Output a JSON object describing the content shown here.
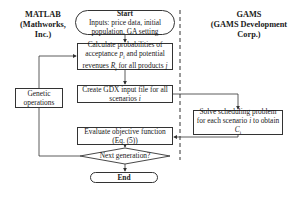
{
  "lanes": {
    "left": {
      "title_line1": "MATLAB",
      "title_line2": "(Mathworks,",
      "title_line3": "Inc.)"
    },
    "right": {
      "title_line1": "GAMS",
      "title_line2": "(GAMS Development",
      "title_line3": "Corp.)"
    }
  },
  "nodes": {
    "start": {
      "title": "Start",
      "line1": "Inputs: price data, initial",
      "line2": "population, GA setting"
    },
    "calc": {
      "line1": "Calculate probabilities of",
      "line2_prefix": "acceptance ",
      "line2_var": "p",
      "line2_sub": "j",
      "line2_suffix": " and potential",
      "line3_prefix": "revenues ",
      "line3_var": "R",
      "line3_sub": "j",
      "line3_suffix": " for all products ",
      "line3_var2": "j"
    },
    "gdx": {
      "line1": "Create GDX input file for all",
      "line2_prefix": "scenarios ",
      "line2_var": "i"
    },
    "genetic": {
      "line1": "Genetic",
      "line2": "operations"
    },
    "solve": {
      "line1": "Solve scheduling problem",
      "line2_prefix": "for each scenario ",
      "line2_var": "i",
      "line2_suffix": " to obtain",
      "line3_var": "C",
      "line3_sub": "i"
    },
    "evaluate": {
      "line1": "Evaluate objective function",
      "line2": "(Eq. (5))"
    },
    "decision": {
      "label": "Next generation?"
    },
    "end": {
      "label": "End"
    }
  }
}
